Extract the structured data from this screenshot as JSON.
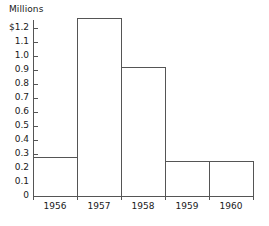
{
  "chart_data": {
    "type": "bar",
    "title": "",
    "subtitle": "",
    "xlabel": "",
    "ylabel": "Millions",
    "categories": [
      "1956",
      "1957",
      "1958",
      "1959",
      "1960"
    ],
    "values": [
      0.28,
      1.27,
      0.92,
      0.25,
      0.25
    ],
    "ylim": [
      0,
      1.27
    ],
    "xlim_categories": 5,
    "ytick_values": [
      0,
      0.1,
      0.2,
      0.3,
      0.4,
      0.5,
      0.6,
      0.7,
      0.8,
      0.9,
      1.0,
      1.1,
      1.2
    ],
    "ytick_labels": [
      "0",
      "0.1",
      "0.2",
      "0.3",
      "0.4",
      "0.5",
      "0.6",
      "0.7",
      "0.8",
      "0.9",
      "1.0",
      "1.1",
      "$1.2"
    ],
    "grid": false,
    "legend": null,
    "legend_position": "none",
    "bar_style": "outline",
    "bar_fill": "#ffffff",
    "bar_stroke": "#555555",
    "axis_color": "#555555",
    "text_color": "#1a1a1a",
    "background": "#ffffff",
    "annotations": [],
    "series": [
      {
        "name": "Millions",
        "values": [
          0.28,
          1.27,
          0.92,
          0.25,
          0.25
        ]
      }
    ]
  },
  "axis": {
    "y_label_text": "Millions"
  }
}
